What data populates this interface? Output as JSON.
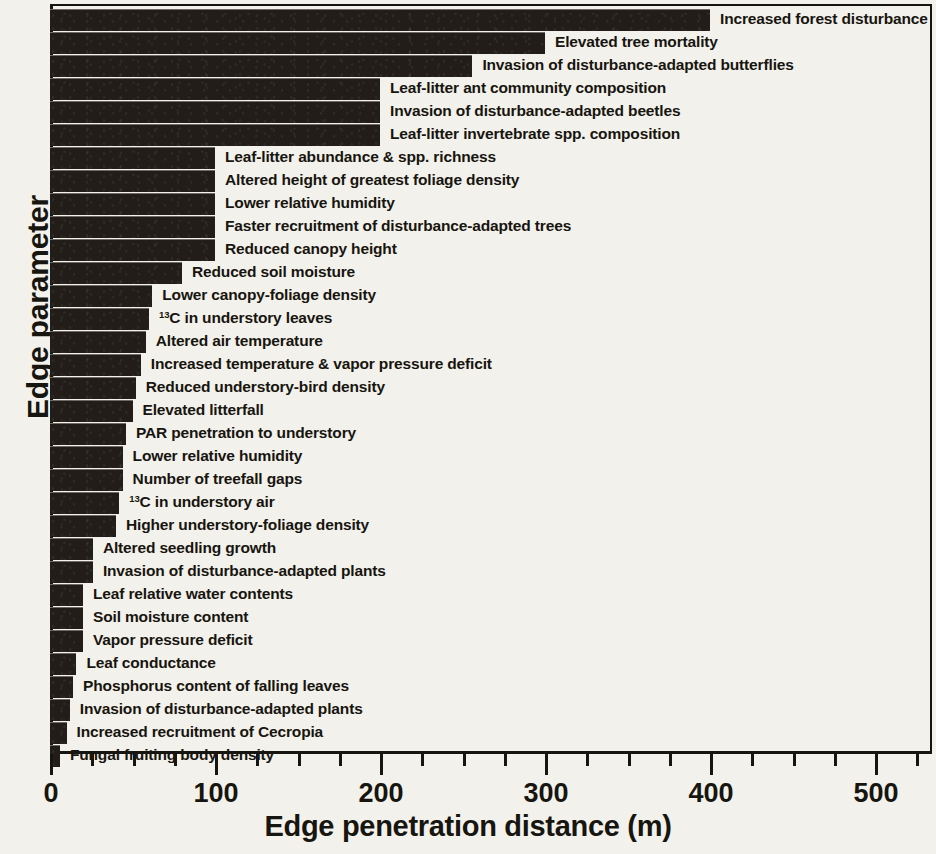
{
  "chart_data": {
    "type": "bar",
    "orientation": "horizontal",
    "title": "",
    "xlabel": "Edge penetration distance (m)",
    "ylabel": "Edge parameter",
    "xlim": [
      0,
      535
    ],
    "ylim": null,
    "grid": false,
    "legend": null,
    "x_ticks_major": [
      0,
      100,
      200,
      300,
      400,
      500
    ],
    "x_ticks_major_labels": [
      "0",
      "100",
      "200",
      "300",
      "400",
      "500"
    ],
    "x_ticks_minor": [
      25,
      50,
      75,
      125,
      150,
      175,
      225,
      250,
      275,
      325,
      350,
      375,
      425,
      450,
      475,
      525
    ],
    "bar_color": "#221d18",
    "axis_color": "#17150f",
    "background_color": "#f3f1ec",
    "categories": [
      "Increased forest disturbance",
      "Elevated tree mortality",
      "Invasion of disturbance-adapted butterflies",
      "Leaf-litter ant community composition",
      "Invasion of disturbance-adapted beetles",
      "Leaf-litter invertebrate spp. composition",
      "Leaf-litter abundance & spp. richness",
      "Altered height of greatest foliage density",
      "Lower relative humidity",
      "Faster recruitment of disturbance-adapted trees",
      "Reduced canopy height",
      "Reduced soil moisture",
      "Lower canopy-foliage density",
      "13C in understory leaves",
      "Altered air temperature",
      "Increased temperature & vapor pressure deficit",
      "Reduced understory-bird density",
      "Elevated litterfall",
      "PAR penetration to understory",
      "Lower relative humidity",
      "Number of treefall gaps",
      "13C in understory air",
      "Higher understory-foliage density",
      "Altered seedling growth",
      "Invasion of disturbance-adapted plants",
      "Leaf relative water contents",
      "Soil moisture content",
      "Vapor pressure deficit",
      "Leaf conductance",
      "Phosphorus content of falling leaves",
      "Invasion of disturbance-adapted plants",
      "Increased recruitment of Cecropia",
      "Fungal fruiting body density"
    ],
    "values": [
      400,
      300,
      256,
      200,
      200,
      200,
      100,
      100,
      100,
      100,
      100,
      80,
      62,
      60,
      58,
      55,
      52,
      50,
      46,
      44,
      44,
      42,
      40,
      26,
      26,
      20,
      20,
      20,
      16,
      14,
      12,
      10,
      6
    ],
    "bars": [
      {
        "label": "Increased forest disturbance",
        "value": 400,
        "label_prefix": "",
        "label_sup": ""
      },
      {
        "label": "Elevated tree mortality",
        "value": 300,
        "label_prefix": "",
        "label_sup": ""
      },
      {
        "label": "Invasion of disturbance-adapted butterflies",
        "value": 256,
        "label_prefix": "",
        "label_sup": ""
      },
      {
        "label": "Leaf-litter ant community composition",
        "value": 200,
        "label_prefix": "",
        "label_sup": ""
      },
      {
        "label": "Invasion of disturbance-adapted beetles",
        "value": 200,
        "label_prefix": "",
        "label_sup": ""
      },
      {
        "label": "Leaf-litter invertebrate spp. composition",
        "value": 200,
        "label_prefix": "",
        "label_sup": ""
      },
      {
        "label": "Leaf-litter abundance & spp. richness",
        "value": 100,
        "label_prefix": "",
        "label_sup": ""
      },
      {
        "label": "Altered height of greatest foliage density",
        "value": 100,
        "label_prefix": "",
        "label_sup": ""
      },
      {
        "label": "Lower relative humidity",
        "value": 100,
        "label_prefix": "",
        "label_sup": ""
      },
      {
        "label": "Faster recruitment of disturbance-adapted trees",
        "value": 100,
        "label_prefix": "",
        "label_sup": ""
      },
      {
        "label": "Reduced canopy height",
        "value": 100,
        "label_prefix": "",
        "label_sup": ""
      },
      {
        "label": "Reduced soil moisture",
        "value": 80,
        "label_prefix": "",
        "label_sup": ""
      },
      {
        "label": "Lower canopy-foliage density",
        "value": 62,
        "label_prefix": "",
        "label_sup": ""
      },
      {
        "label": "C in understory leaves",
        "value": 60,
        "label_prefix": "",
        "label_sup": "13"
      },
      {
        "label": "Altered air temperature",
        "value": 58,
        "label_prefix": "",
        "label_sup": ""
      },
      {
        "label": "Increased temperature & vapor pressure deficit",
        "value": 55,
        "label_prefix": "",
        "label_sup": ""
      },
      {
        "label": "Reduced understory-bird density",
        "value": 52,
        "label_prefix": "",
        "label_sup": ""
      },
      {
        "label": "Elevated litterfall",
        "value": 50,
        "label_prefix": "",
        "label_sup": ""
      },
      {
        "label": "PAR penetration to understory",
        "value": 46,
        "label_prefix": "",
        "label_sup": ""
      },
      {
        "label": "Lower relative humidity",
        "value": 44,
        "label_prefix": "",
        "label_sup": ""
      },
      {
        "label": "Number of treefall gaps",
        "value": 44,
        "label_prefix": "",
        "label_sup": ""
      },
      {
        "label": "C in understory air",
        "value": 42,
        "label_prefix": "",
        "label_sup": "13"
      },
      {
        "label": "Higher understory-foliage density",
        "value": 40,
        "label_prefix": "",
        "label_sup": ""
      },
      {
        "label": "Altered seedling growth",
        "value": 26,
        "label_prefix": "",
        "label_sup": ""
      },
      {
        "label": "Invasion of disturbance-adapted plants",
        "value": 26,
        "label_prefix": "",
        "label_sup": ""
      },
      {
        "label": "Leaf relative water contents",
        "value": 20,
        "label_prefix": "",
        "label_sup": ""
      },
      {
        "label": "Soil moisture content",
        "value": 20,
        "label_prefix": "",
        "label_sup": ""
      },
      {
        "label": "Vapor pressure deficit",
        "value": 20,
        "label_prefix": "",
        "label_sup": ""
      },
      {
        "label": "Leaf conductance",
        "value": 16,
        "label_prefix": "",
        "label_sup": ""
      },
      {
        "label": "Phosphorus content of falling leaves",
        "value": 14,
        "label_prefix": "",
        "label_sup": ""
      },
      {
        "label": "Invasion of disturbance-adapted plants",
        "value": 12,
        "label_prefix": "",
        "label_sup": ""
      },
      {
        "label": "Increased recruitment of Cecropia",
        "value": 10,
        "label_prefix": "",
        "label_sup": ""
      },
      {
        "label": "Fungal fruiting body density",
        "value": 6,
        "label_prefix": "",
        "label_sup": ""
      }
    ]
  }
}
